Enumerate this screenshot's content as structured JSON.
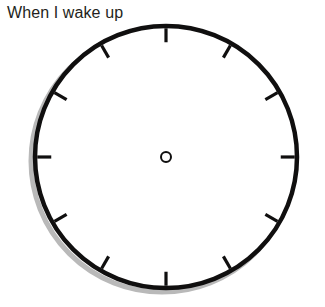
{
  "page": {
    "background_color": "#ffffff",
    "width": 325,
    "height": 307
  },
  "prompt": {
    "title": "When I wake up",
    "text_color": "#231f20",
    "font_size_px": 16
  },
  "clock": {
    "name": "analog-clock-face",
    "style": "blank worksheet clock, no hands drawn",
    "center_x": 166,
    "center_y": 157,
    "radius": 131,
    "rim_color": "#100f0f",
    "rim_width_px": 4.5,
    "face_color": "#ffffff",
    "shadow_color": "#b9b9b9",
    "shadow_offset_x": -4,
    "shadow_offset_y": 4,
    "hub": {
      "name": "center-hub-ring",
      "outer_radius": 6,
      "stroke_width": 2,
      "color": "#100f0f",
      "filled": false
    },
    "hands": [],
    "hand_count": 0,
    "tick_marks": {
      "count": 12,
      "color": "#100f0f",
      "width_px": 3.2,
      "length_px": 14,
      "positions_hours": [
        12,
        1,
        2,
        3,
        4,
        5,
        6,
        7,
        8,
        9,
        10,
        11
      ],
      "angles_deg": [
        0,
        30,
        60,
        90,
        120,
        150,
        180,
        210,
        240,
        270,
        300,
        330
      ]
    }
  }
}
